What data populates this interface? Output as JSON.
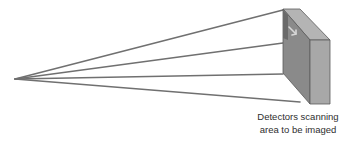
{
  "diagram": {
    "type": "scanning-geometry",
    "apex": {
      "x": 15,
      "y": 79
    },
    "rays": [
      {
        "x": 283,
        "y": 10
      },
      {
        "x": 283,
        "y": 43
      },
      {
        "x": 283,
        "y": 74
      },
      {
        "x": 300,
        "y": 102
      }
    ],
    "detector_block": {
      "top_face": [
        [
          283,
          9
        ],
        [
          300,
          9
        ],
        [
          330,
          40
        ],
        [
          310,
          40
        ]
      ],
      "front_face": [
        [
          283,
          9
        ],
        [
          310,
          40
        ],
        [
          310,
          104
        ],
        [
          283,
          73
        ]
      ],
      "side_face": [
        [
          310,
          40
        ],
        [
          330,
          40
        ],
        [
          330,
          104
        ],
        [
          310,
          104
        ]
      ]
    },
    "colors": {
      "ray": "#707070",
      "top_face": "#b4b4b4",
      "front_face": "#8a8a8a",
      "side_face": "#a8a8a8",
      "edge": "#5a5a5a",
      "scan_strip": "#6a6a6a",
      "arrow": "#d8d8d8"
    },
    "caption": {
      "line1": "Detectors scanning",
      "line2": "area to be imaged"
    }
  }
}
